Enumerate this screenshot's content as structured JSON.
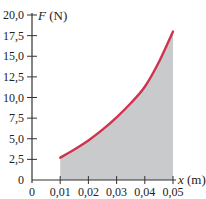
{
  "chart_data": {
    "type": "area",
    "title": "",
    "xlabel_var": "x",
    "xlabel_unit": " (m)",
    "ylabel_var": "F",
    "ylabel_unit": " (N)",
    "xlim": [
      0,
      0.05
    ],
    "ylim": [
      0,
      20
    ],
    "xticks": [
      0,
      0.01,
      0.02,
      0.03,
      0.04,
      0.05
    ],
    "xtick_labels": [
      "0",
      "0,01",
      "0,02",
      "0,03",
      "0,04",
      "0,05"
    ],
    "yticks": [
      0,
      2.5,
      5,
      7.5,
      10,
      12.5,
      15,
      17.5,
      20
    ],
    "ytick_labels": [
      "0",
      "2,5",
      "5,0",
      "7,5",
      "10,0",
      "12,5",
      "15,0",
      "17,5",
      "20,0"
    ],
    "grid": false,
    "series": [
      {
        "name": "F(x)",
        "x": [
          0.01,
          0.015,
          0.02,
          0.025,
          0.03,
          0.035,
          0.04,
          0.045,
          0.05
        ],
        "values": [
          2.7,
          3.7,
          4.8,
          6.1,
          7.6,
          9.3,
          11.3,
          14.3,
          18.0
        ],
        "color": "#d0324f",
        "fill": "#c9cacb"
      }
    ]
  }
}
